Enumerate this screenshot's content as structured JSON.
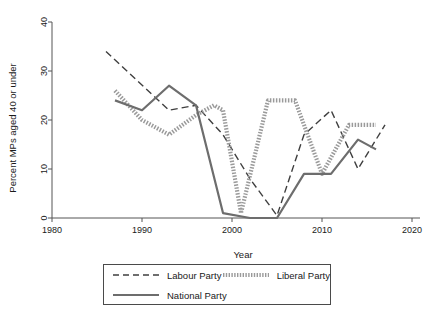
{
  "chart_data": {
    "type": "line",
    "title": "",
    "xlabel": "Year",
    "ylabel": "Percent MPs aged 40 or under",
    "xlim": [
      1980,
      2020
    ],
    "ylim": [
      0,
      40
    ],
    "xticks": [
      1980,
      1990,
      2000,
      2010,
      2020
    ],
    "yticks": [
      0,
      10,
      20,
      30,
      40
    ],
    "grid": false,
    "legend_position": "bottom",
    "series": [
      {
        "name": "Labour Party",
        "style": "dashed",
        "color": "#3f3f3f",
        "x": [
          1986,
          1993,
          1996,
          1999,
          2002,
          2005,
          2008,
          2011,
          2014,
          2017
        ],
        "values": [
          34,
          22,
          23,
          17,
          8,
          0.5,
          17,
          22,
          10,
          19
        ]
      },
      {
        "name": "Liberal Party",
        "style": "dotted",
        "color": "#9a9a9a",
        "x": [
          1987,
          1990,
          1993,
          1996,
          1998,
          1999,
          2001,
          2004,
          2007,
          2010,
          2013,
          2016
        ],
        "values": [
          26,
          20,
          17,
          21,
          23,
          22,
          1,
          24,
          24,
          9,
          19,
          19
        ]
      },
      {
        "name": "National Party",
        "style": "solid",
        "color": "#6d6d6d",
        "x": [
          1987,
          1990,
          1993,
          1996,
          1999,
          2002,
          2005,
          2008,
          2011,
          2014,
          2016
        ],
        "values": [
          24,
          22,
          27,
          23,
          1,
          0,
          0,
          9,
          9,
          16,
          14
        ]
      }
    ]
  },
  "axes": {
    "y_title": "Percent MPs aged 40 or under",
    "x_title": "Year",
    "y_tick_labels": [
      "0",
      "10",
      "20",
      "30",
      "40"
    ],
    "x_tick_labels": [
      "1980",
      "1990",
      "2000",
      "2010",
      "2020"
    ]
  },
  "legend": {
    "items": [
      {
        "label": "Labour Party",
        "style": "dashed"
      },
      {
        "label": "Liberal Party",
        "style": "dotted"
      },
      {
        "label": "National Party",
        "style": "solid"
      }
    ]
  }
}
